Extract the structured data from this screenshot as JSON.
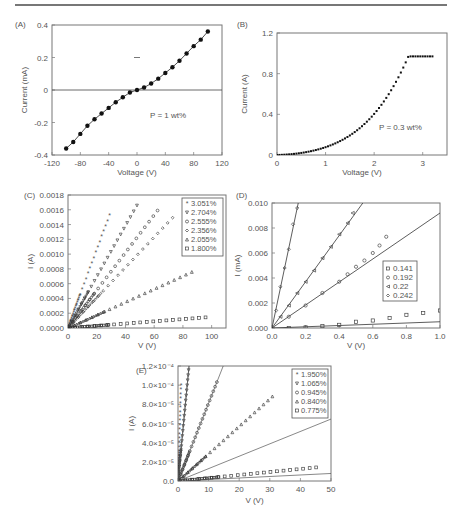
{
  "chart_data": [
    {
      "panel": "(A)",
      "type": "line",
      "xlabel": "Voltage (V)",
      "ylabel": "Current (mA)",
      "xlim": [
        -120,
        120
      ],
      "ylim": [
        -0.4,
        0.4
      ],
      "xticks": [
        "-120",
        "-80",
        "-40",
        "0",
        "40",
        "80",
        "120"
      ],
      "yticks": [
        "-0.4",
        "-0.2",
        "0",
        "0.2",
        "0.4"
      ],
      "annotation": "P = 1 wt%",
      "series": [
        {
          "name": "P = 1 wt%",
          "x": [
            -100,
            -90,
            -80,
            -70,
            -60,
            -50,
            -40,
            -30,
            -20,
            -10,
            0,
            10,
            20,
            30,
            40,
            50,
            60,
            70,
            80,
            90,
            100
          ],
          "y": [
            -0.36,
            -0.32,
            -0.27,
            -0.22,
            -0.18,
            -0.145,
            -0.11,
            -0.075,
            -0.045,
            -0.015,
            0.0,
            0.015,
            0.04,
            0.07,
            0.105,
            0.14,
            0.18,
            0.225,
            0.27,
            0.31,
            0.36
          ]
        }
      ]
    },
    {
      "panel": "(B)",
      "type": "scatter",
      "xlabel": "Voltage (V)",
      "ylabel": "Current (A)",
      "xlim": [
        0,
        3.5
      ],
      "ylim": [
        0,
        1.2
      ],
      "xticks": [
        "0",
        "1",
        "2",
        "3"
      ],
      "yticks": [
        "0",
        "0.4",
        "0.8",
        "1.2"
      ],
      "annotation": "P = 0.3 wt%",
      "series": [
        {
          "name": "P = 0.3 wt%",
          "x": [
            0,
            0.2,
            0.4,
            0.6,
            0.8,
            1.0,
            1.2,
            1.4,
            1.6,
            1.8,
            2.0,
            2.2,
            2.4,
            2.6,
            2.8,
            3.0,
            3.2
          ],
          "y": [
            0,
            0.01,
            0.025,
            0.04,
            0.06,
            0.09,
            0.12,
            0.16,
            0.2,
            0.25,
            0.31,
            0.39,
            0.48,
            0.57,
            0.67,
            0.8,
            0.97
          ]
        }
      ]
    },
    {
      "panel": "(C)",
      "type": "scatter",
      "xlabel": "V (V)",
      "ylabel": "I (A)",
      "xlim": [
        0,
        110
      ],
      "ylim": [
        0,
        0.0018
      ],
      "xticks": [
        "0",
        "20",
        "40",
        "60",
        "80",
        "100"
      ],
      "yticks": [
        "0.0000",
        "0.0002",
        "0.0004",
        "0.0006",
        "0.0008",
        "0.0010",
        "0.0012",
        "0.0014",
        "0.0016",
        "0.0018"
      ],
      "legend_position": "upper right",
      "series": [
        {
          "name": "3.051%",
          "marker": "star",
          "slope": 5.25e-05,
          "xmax": 30
        },
        {
          "name": "2.704%",
          "marker": "triangle-down",
          "slope": 3.45e-05,
          "xmax": 50
        },
        {
          "name": "2.555%",
          "marker": "circle",
          "slope": 2.55e-05,
          "xmax": 65
        },
        {
          "name": "2.356%",
          "marker": "diamond",
          "slope": 2.05e-05,
          "xmax": 76
        },
        {
          "name": "2.055%",
          "marker": "triangle-up",
          "slope": 8.8e-06,
          "xmax": 90
        },
        {
          "name": "1.800%",
          "marker": "square",
          "slope": 1.5e-06,
          "xmax": 100
        }
      ]
    },
    {
      "panel": "(D)",
      "type": "scatter",
      "xlabel": "V (V)",
      "ylabel": "I (mA)",
      "xlim": [
        0,
        1.0
      ],
      "ylim": [
        0,
        0.01
      ],
      "xticks": [
        "0.0",
        "0.2",
        "0.4",
        "0.6",
        "0.8",
        "1.0"
      ],
      "yticks": [
        "0.000",
        "0.002",
        "0.004",
        "0.006",
        "0.008",
        "0.010"
      ],
      "legend_position": "center right",
      "series": [
        {
          "name": "0.141",
          "marker": "square",
          "x": [
            0.1,
            0.2,
            0.3,
            0.4,
            0.5,
            0.6,
            0.7,
            0.8,
            0.9,
            1.0
          ],
          "y": [
            0.0,
            5e-05,
            0.00015,
            0.00025,
            0.0005,
            0.0006,
            0.0008,
            0.00105,
            0.0012,
            0.0014
          ],
          "fit_slope": 0.0005
        },
        {
          "name": "0.192",
          "marker": "circle",
          "x": [
            0.1,
            0.2,
            0.3,
            0.4,
            0.45,
            0.5,
            0.55,
            0.6,
            0.64,
            0.68
          ],
          "y": [
            0.0009,
            0.0018,
            0.0028,
            0.0037,
            0.0043,
            0.0049,
            0.0054,
            0.006,
            0.0066,
            0.0073
          ],
          "fit_slope": 0.0092
        },
        {
          "name": "0.22",
          "marker": "triangle-left",
          "x": [
            0.05,
            0.1,
            0.15,
            0.2,
            0.25,
            0.3,
            0.35,
            0.4,
            0.45,
            0.48
          ],
          "y": [
            0.0009,
            0.0018,
            0.0028,
            0.0037,
            0.0046,
            0.0056,
            0.0065,
            0.0075,
            0.0084,
            0.0092
          ],
          "fit_slope": 0.0185
        },
        {
          "name": "0.242",
          "marker": "diamond",
          "x": [
            0.025,
            0.05,
            0.075,
            0.1,
            0.125,
            0.15
          ],
          "y": [
            0.0014,
            0.0033,
            0.0048,
            0.0063,
            0.0083,
            0.0096
          ],
          "fit_slope": 0.064
        }
      ]
    },
    {
      "panel": "(E)",
      "type": "scatter",
      "xlabel": "V (V)",
      "ylabel": "I (A)",
      "xlim": [
        0,
        50
      ],
      "ylim": [
        0,
        0.00013
      ],
      "xticks": [
        "0",
        "10",
        "20",
        "30",
        "40",
        "50"
      ],
      "yticks": [
        "0.0",
        "2.0×10⁻⁵",
        "4.0×10⁻⁵",
        "6.0×10⁻⁵",
        "8.0×10⁻⁵",
        "1.0×10⁻⁴",
        "1.2×10⁻⁴"
      ],
      "legend_position": "upper right",
      "series": [
        {
          "name": "1.950%",
          "marker": "star",
          "slope": 0.00011,
          "xmax": 1.0
        },
        {
          "name": "1.065%",
          "marker": "triangle-down",
          "slope": 3.6e-05,
          "xmax": 3.5
        },
        {
          "name": "0.945%",
          "marker": "circle",
          "slope": 8.8e-06,
          "xmax": 13
        },
        {
          "name": "0.840%",
          "marker": "triangle-up",
          "slope": 3.1e-06,
          "xmax": 32
        },
        {
          "name": "0.775%",
          "marker": "square",
          "slope": 3.4e-07,
          "xmax": 47
        }
      ]
    }
  ]
}
